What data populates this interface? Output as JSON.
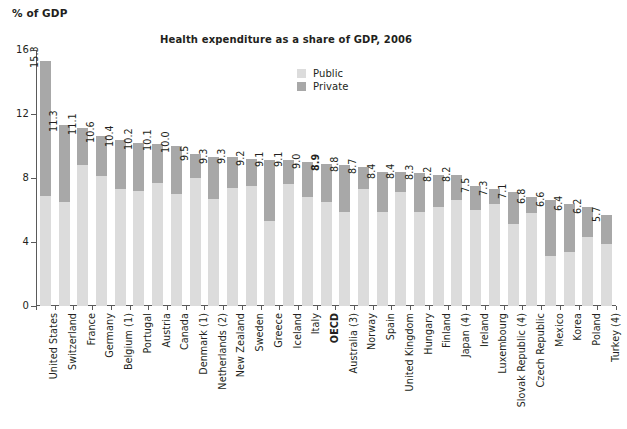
{
  "axis_unit_label": "% of GDP",
  "legend": {
    "items": [
      {
        "label": "Public",
        "color": "#dcdcdc"
      },
      {
        "label": "Private",
        "color": "#a8a8a8"
      }
    ]
  },
  "chart_data": {
    "type": "bar",
    "subtype": "stacked-vertical",
    "title": "Health expenditure as a share of GDP, 2006",
    "xlabel": "",
    "ylabel": "% of GDP",
    "ylim": [
      0,
      16
    ],
    "yticks": [
      0,
      4,
      8,
      12,
      16
    ],
    "grid": false,
    "legend_position": "top-center-right",
    "colors": {
      "public": "#dcdcdc",
      "private": "#a8a8a8"
    },
    "highlight_category": "OECD",
    "categories": [
      "United States",
      "Switzerland",
      "France",
      "Germany",
      "Belgium (1)",
      "Portugal",
      "Austria",
      "Canada",
      "Denmark (1)",
      "Netherlands (2)",
      "New Zealand",
      "Sweden",
      "Greece",
      "Iceland",
      "Italy",
      "OECD",
      "Australia (3)",
      "Norway",
      "Spain",
      "United Kingdom",
      "Hungary",
      "Finland",
      "Japan (4)",
      "Ireland",
      "Luxembourg",
      "Slovak Republic (4)",
      "Czech Republic",
      "Mexico",
      "Korea",
      "Poland",
      "Turkey (4)"
    ],
    "totals": [
      15.3,
      11.3,
      11.1,
      10.6,
      10.4,
      10.2,
      10.1,
      10.0,
      9.5,
      9.3,
      9.3,
      9.2,
      9.1,
      9.1,
      9.0,
      8.9,
      8.8,
      8.7,
      8.4,
      8.4,
      8.3,
      8.2,
      8.2,
      7.5,
      7.3,
      7.1,
      6.8,
      6.6,
      6.4,
      6.2,
      5.7
    ],
    "value_labels": [
      "15.3",
      "11.3",
      "11.1",
      "10.6",
      "10.4",
      "10.2",
      "10.1",
      "10.0",
      "9.5",
      "9.3",
      "9.3",
      "9.2",
      "9.1",
      "9.1",
      "9.0",
      "8.9",
      "8.8",
      "8.7",
      "8.4",
      "8.4",
      "8.3",
      "8.2",
      "8.2",
      "7.5",
      "7.3",
      "7.1",
      "6.8",
      "6.6",
      "6.4",
      "6.2",
      "5.7"
    ],
    "series": [
      {
        "name": "Public",
        "values": [
          6.9,
          6.5,
          8.8,
          8.1,
          7.3,
          7.2,
          7.7,
          7.0,
          8.0,
          6.7,
          7.4,
          7.5,
          5.3,
          7.6,
          6.8,
          6.5,
          5.9,
          7.3,
          5.9,
          7.1,
          5.9,
          6.2,
          6.6,
          6.0,
          6.4,
          5.1,
          5.8,
          3.1,
          3.4,
          4.3,
          3.9
        ]
      },
      {
        "name": "Private",
        "values": [
          8.4,
          4.8,
          2.3,
          2.5,
          3.1,
          3.0,
          2.4,
          3.0,
          1.5,
          2.6,
          1.9,
          1.7,
          3.8,
          1.5,
          2.2,
          2.4,
          2.9,
          1.4,
          2.5,
          1.3,
          2.4,
          2.0,
          1.6,
          1.5,
          0.9,
          2.0,
          1.0,
          3.5,
          3.0,
          1.9,
          1.8
        ]
      }
    ]
  }
}
